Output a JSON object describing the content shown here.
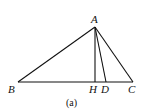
{
  "diagram": {
    "caption": "(a)",
    "points": {
      "A": {
        "label": "A",
        "x": 95,
        "y": 27
      },
      "B": {
        "label": "B",
        "x": 18,
        "y": 82
      },
      "H": {
        "label": "H",
        "x": 95,
        "y": 82
      },
      "D": {
        "label": "D",
        "x": 106,
        "y": 82
      },
      "C": {
        "label": "C",
        "x": 133,
        "y": 82
      }
    },
    "segments": [
      "AB",
      "AC",
      "BC",
      "AH",
      "AD"
    ]
  }
}
